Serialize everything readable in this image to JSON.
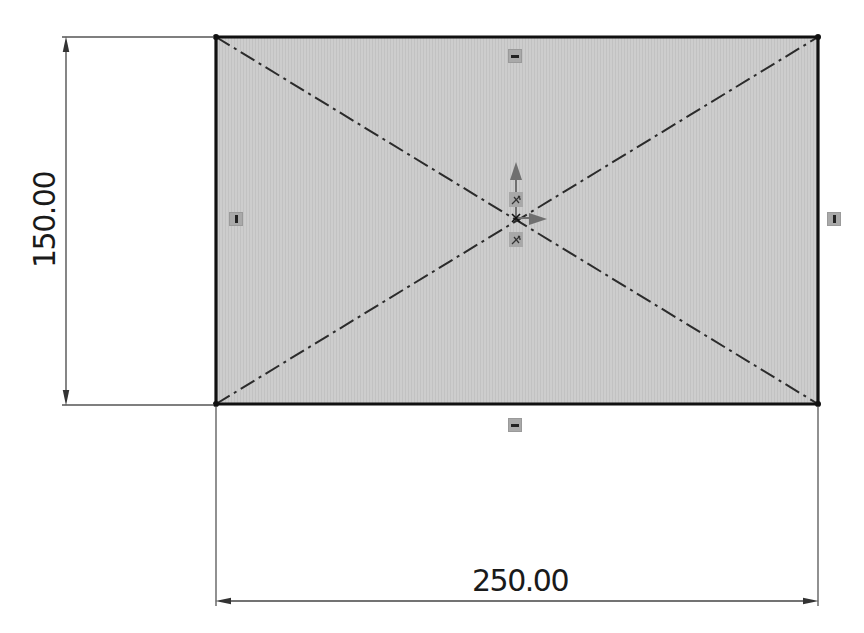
{
  "sketch": {
    "rectangle": {
      "width_value": "250.00",
      "height_value": "150.00",
      "fill_color": "#cbcbcb",
      "edge_color": "#111111",
      "centerline_color": "#2b2b2b"
    },
    "dimensions": {
      "horizontal": {
        "label": "250.00"
      },
      "vertical": {
        "label": "150.00"
      }
    },
    "relations": {
      "top_edge": "horizontal",
      "bottom_edge": "horizontal",
      "left_edge": "vertical",
      "right_edge": "vertical",
      "origin": [
        "coincident",
        "coincident"
      ]
    },
    "origin_axes": {
      "color": "#6f6f6f"
    }
  }
}
